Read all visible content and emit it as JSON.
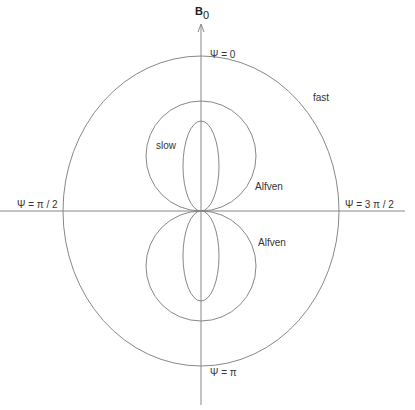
{
  "axis": {
    "vertical_label": "B",
    "vertical_label_subscript": "0"
  },
  "angles": {
    "top": "Ψ  = 0",
    "left": "Ψ  =  π / 2",
    "right": "Ψ  = 3 π / 2",
    "bottom": "Ψ  =  π"
  },
  "curves": {
    "fast": "fast",
    "slow": "slow",
    "alfven_upper": "Alfven",
    "alfven_lower": "Alfven"
  },
  "colors": {
    "line": "#888888",
    "text": "#333333"
  }
}
